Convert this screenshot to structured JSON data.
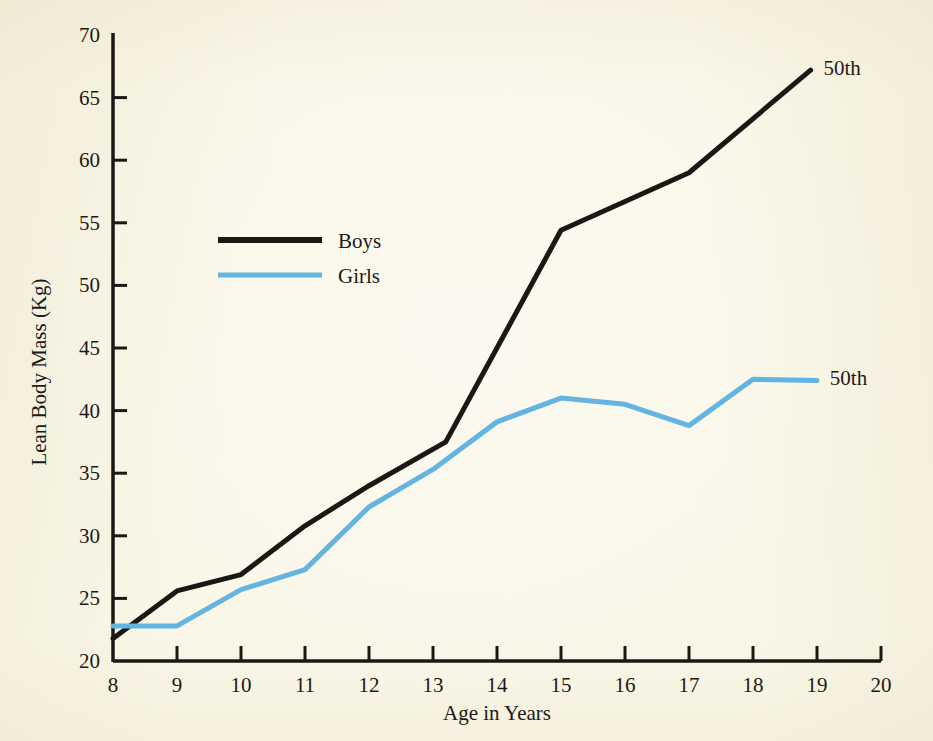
{
  "figure": {
    "background_color": "#faf7e8",
    "axis_color": "#1a1814"
  },
  "chart_data": {
    "type": "line",
    "title": "",
    "subtitle": "",
    "xlabel": "Age in Years",
    "ylabel": "Lean Body Mass (Kg)",
    "xlim": [
      8,
      20
    ],
    "ylim": [
      20,
      70
    ],
    "xticks": [
      8,
      9,
      10,
      11,
      12,
      13,
      14,
      15,
      16,
      17,
      18,
      19,
      20
    ],
    "xtick_labels": [
      "8",
      "9",
      "10",
      "11",
      "12",
      "13",
      "14",
      "15",
      "16",
      "17",
      "18",
      "19",
      "20"
    ],
    "yticks": [
      20,
      25,
      30,
      35,
      40,
      45,
      50,
      55,
      60,
      65,
      70
    ],
    "ytick_labels": [
      "20",
      "25",
      "30",
      "35",
      "40",
      "45",
      "50",
      "55",
      "60",
      "65",
      "70"
    ],
    "grid": false,
    "legend_position": "upper-left-inside",
    "series": [
      {
        "name": "Boys",
        "color": "#1a1714",
        "line_width": 5,
        "end_annotation": "50th",
        "x": [
          8,
          9,
          10,
          11,
          12,
          13.2,
          15,
          17,
          18.9
        ],
        "values": [
          21.8,
          25.6,
          26.9,
          30.8,
          34.0,
          37.5,
          54.4,
          59.0,
          67.2
        ]
      },
      {
        "name": "Girls",
        "color": "#63b4e0",
        "line_width": 5,
        "end_annotation": "50th",
        "x": [
          8,
          9,
          10,
          11,
          12,
          13,
          14,
          15,
          16,
          17,
          18,
          19
        ],
        "values": [
          22.8,
          22.8,
          25.7,
          27.3,
          32.3,
          35.3,
          39.1,
          41.0,
          40.5,
          38.8,
          42.5,
          42.4
        ]
      }
    ],
    "annotations": [
      {
        "text": "50th",
        "series": "Boys",
        "x": 19.1,
        "y": 67.4
      },
      {
        "text": "50th",
        "series": "Girls",
        "x": 19.2,
        "y": 42.6
      }
    ]
  },
  "legend": {
    "entries": [
      {
        "label": "Boys",
        "color": "#1a1714"
      },
      {
        "label": "Girls",
        "color": "#63b4e0"
      }
    ]
  }
}
